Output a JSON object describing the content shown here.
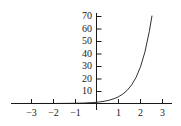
{
  "figure": {
    "name": "exponential-growth-curve",
    "background_color": "#ffffff",
    "axis_color": "#1a1a1a",
    "curve_color": "#1a1a1a"
  },
  "chart_data": {
    "type": "line",
    "title": "",
    "subtitle": "",
    "xlabel": "",
    "ylabel": "",
    "xlim": [
      -3.45,
      3.35
    ],
    "ylim": [
      -6,
      75
    ],
    "grid": false,
    "legend": null,
    "x_ticks": [
      -3,
      -2,
      -1,
      1,
      2,
      3
    ],
    "x_tick_labels": [
      "−3",
      "−2",
      "−1",
      "1",
      "2",
      "3"
    ],
    "y_ticks": [
      10,
      20,
      30,
      40,
      50,
      60,
      70
    ],
    "y_tick_labels": [
      "10",
      "20",
      "30",
      "40",
      "50",
      "60",
      "70"
    ],
    "series": [
      {
        "name": "exponential",
        "equation": "y = e^(1.69x)",
        "x": [
          -3.4,
          -3.0,
          -2.6,
          -2.2,
          -1.8,
          -1.4,
          -1.0,
          -0.6,
          -0.2,
          0.0,
          0.2,
          0.4,
          0.6,
          0.8,
          1.0,
          1.2,
          1.4,
          1.6,
          1.8,
          2.0,
          2.2,
          2.4,
          2.52
        ],
        "y": [
          0.0,
          0.01,
          0.01,
          0.02,
          0.05,
          0.09,
          0.18,
          0.36,
          0.71,
          1.0,
          1.4,
          1.97,
          2.76,
          3.87,
          5.42,
          7.6,
          10.65,
          14.93,
          20.93,
          29.34,
          41.13,
          57.66,
          70.0
        ]
      }
    ],
    "x_ticks_minor": [],
    "y_ticks_minor": []
  },
  "axis_labels": {
    "y": [
      {
        "value": 70,
        "text": "70"
      },
      {
        "value": 60,
        "text": "60"
      },
      {
        "value": 50,
        "text": "50"
      },
      {
        "value": 40,
        "text": "40"
      },
      {
        "value": 30,
        "text": "30"
      },
      {
        "value": 20,
        "text": "20"
      },
      {
        "value": 10,
        "text": "10"
      }
    ],
    "x": [
      {
        "value": -3,
        "text": "−3"
      },
      {
        "value": -2,
        "text": "−2"
      },
      {
        "value": -1,
        "text": "−1"
      },
      {
        "value": 1,
        "text": "1"
      },
      {
        "value": 2,
        "text": "2"
      },
      {
        "value": 3,
        "text": "3"
      }
    ]
  }
}
